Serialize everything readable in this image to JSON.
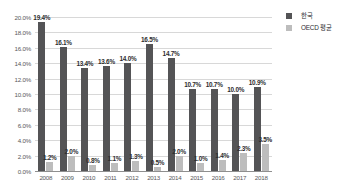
{
  "chart_data": {
    "type": "bar",
    "title": "",
    "subtitle": "",
    "xlabel": "",
    "ylabel": "",
    "ylim": [
      0,
      20
    ],
    "ytick_step": 2,
    "grid": true,
    "legend_position": "right",
    "categories": [
      "2008",
      "2009",
      "2010",
      "2011",
      "2012",
      "2013",
      "2014",
      "2015",
      "2016",
      "2017",
      "2018"
    ],
    "ytick_labels": [
      "20.0%",
      "18.0%",
      "16.0%",
      "14.0%",
      "12.0%",
      "10.0%",
      "8.0%",
      "6.0%",
      "4.0%",
      "2.0%",
      "0.0%"
    ],
    "ytick_values": [
      20,
      18,
      16,
      14,
      12,
      10,
      8,
      6,
      4,
      2,
      0
    ],
    "series": [
      {
        "name": "한국",
        "color": "#545456",
        "values": [
          19.4,
          16.1,
          13.4,
          13.6,
          14.0,
          16.5,
          14.7,
          10.7,
          10.7,
          10.0,
          10.9
        ],
        "labels": [
          "19.4%",
          "16.1%",
          "13.4%",
          "13.6%",
          "14.0%",
          "16.5%",
          "14.7%",
          "10.7%",
          "10.7%",
          "10.0%",
          "10.9%"
        ]
      },
      {
        "name": "OECD 평균",
        "color": "#bdbdbd",
        "values": [
          1.2,
          2.0,
          0.8,
          1.1,
          1.3,
          0.5,
          2.0,
          1.0,
          1.4,
          2.3,
          3.5
        ],
        "labels": [
          "1.2%",
          "2.0%",
          "0.8%",
          "1.1%",
          "1.3%",
          "0.5%",
          "2.0%",
          "1.0%",
          "1.4%",
          "2.3%",
          "3.5%"
        ]
      }
    ]
  },
  "legend": {
    "entries": [
      {
        "label": "한국",
        "color": "#545456"
      },
      {
        "label": "OECD 평균",
        "color": "#bdbdbd"
      }
    ]
  },
  "colors": {
    "korea_bar": "#545456",
    "oecd_bar": "#bdbdbd",
    "gridline": "#d8d8d8",
    "axis_line": "#8f8f8f",
    "tick_text": "#58585a",
    "value_text": "#2e2e30",
    "background": "#ffffff"
  }
}
